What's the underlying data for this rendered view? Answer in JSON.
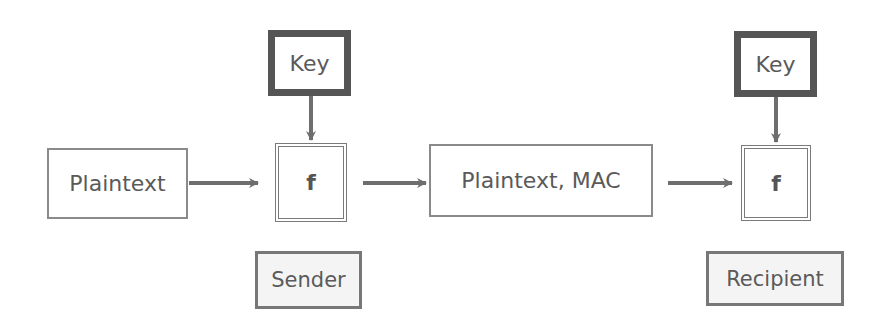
{
  "diagram": {
    "title": "",
    "nodes": {
      "plaintext": "Plaintext",
      "sender_key": "Key",
      "sender_f": "f",
      "plaintext_mac": "Plaintext, MAC",
      "recipient_key": "Key",
      "recipient_f": "f",
      "sender_label": "Sender",
      "recipient_label": "Recipient"
    },
    "edges": [
      {
        "from": "plaintext",
        "to": "sender_f"
      },
      {
        "from": "sender_key",
        "to": "sender_f"
      },
      {
        "from": "sender_f",
        "to": "plaintext_mac"
      },
      {
        "from": "plaintext_mac",
        "to": "recipient_f"
      },
      {
        "from": "recipient_key",
        "to": "recipient_f"
      }
    ],
    "colors": {
      "line": "#6e6e6e",
      "key_border": "#555555",
      "text": "#5a5a5a"
    }
  }
}
